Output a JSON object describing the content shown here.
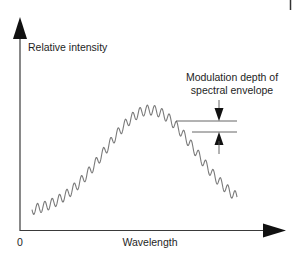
{
  "diagram": {
    "title": "",
    "y_axis_label": "Relative intensity",
    "x_axis_label": "Wavelength",
    "origin_label": "0",
    "annotation": {
      "line1": "Modulation depth of",
      "line2": "spectral envelope"
    },
    "colors": {
      "axes": "#3a3a3a",
      "curve": "#7a7a7a",
      "arrows": "#111111",
      "text": "#1e1e1e"
    },
    "curve": {
      "envelope": "gaussian",
      "x_start": 32,
      "x_end": 237,
      "peak_x": 150,
      "baseline_y": 213,
      "peak_y": 110,
      "oscillations": 28,
      "amplitude_px": 5
    }
  }
}
